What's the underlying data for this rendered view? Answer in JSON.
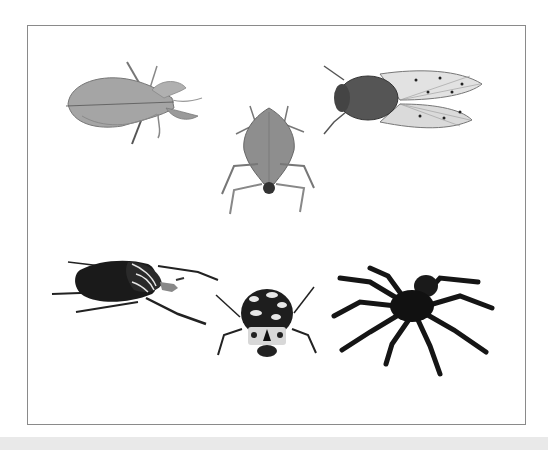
{
  "scene": {
    "description": "Six arthropod specimens photographed from above on a white background inside a thin gray frame",
    "background": "#ffffff",
    "frame_color": "#8a8a8a",
    "bottom_band_color": "#e9e9e9",
    "specimens": [
      {
        "id": "leaf-insect",
        "label": "Leaf insect",
        "position": "top-left",
        "tone": "#8c8c8c"
      },
      {
        "id": "leaf-footed-bug",
        "label": "Leaf-footed bug",
        "position": "top-center",
        "tone": "#7a7a7a"
      },
      {
        "id": "cicada",
        "label": "Cicada",
        "position": "top-right",
        "tone": "#5a5a5a"
      },
      {
        "id": "goliath-beetle",
        "label": "Goliath beetle",
        "position": "bottom-left",
        "tone": "#1a1a1a"
      },
      {
        "id": "spotted-beetle",
        "label": "Spotted beetle",
        "position": "bottom-center",
        "tone": "#222222"
      },
      {
        "id": "tarantula",
        "label": "Tarantula",
        "position": "bottom-right",
        "tone": "#151515"
      }
    ]
  }
}
